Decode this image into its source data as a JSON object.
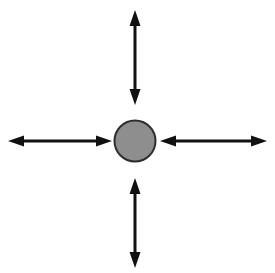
{
  "figure": {
    "title": "Radial double-headed arrow diagram",
    "type": "diagram",
    "canvas": {
      "width": 275,
      "height": 273,
      "background_color": "#ffffff"
    },
    "center_node": {
      "shape_name": "circle",
      "label": "",
      "center_x": 135,
      "center_y": 141,
      "radius": 20.5,
      "fill_color": "#8e8e8e",
      "stroke_color": "#2e2e2e",
      "stroke_width": 2
    },
    "arrow_style": {
      "shaft_color": "#111111",
      "shaft_width": 3,
      "head_color": "#111111",
      "head_length": 16,
      "head_width": 11,
      "double_headed": true
    },
    "arrows": [
      {
        "name": "up-arrow",
        "direction": "up",
        "heads": "both",
        "x1": 135,
        "y1": 105,
        "x2": 135,
        "y2": 10,
        "label": ""
      },
      {
        "name": "down-arrow",
        "direction": "down",
        "heads": "both",
        "x1": 135,
        "y1": 178,
        "x2": 135,
        "y2": 268,
        "label": ""
      },
      {
        "name": "left-arrow",
        "direction": "left",
        "heads": "both",
        "x1": 112,
        "y1": 141,
        "x2": 8,
        "y2": 141,
        "label": ""
      },
      {
        "name": "right-arrow",
        "direction": "right",
        "heads": "both",
        "x1": 160,
        "y1": 141,
        "x2": 267,
        "y2": 141,
        "label": ""
      }
    ],
    "annotations": [],
    "text_present": false
  }
}
